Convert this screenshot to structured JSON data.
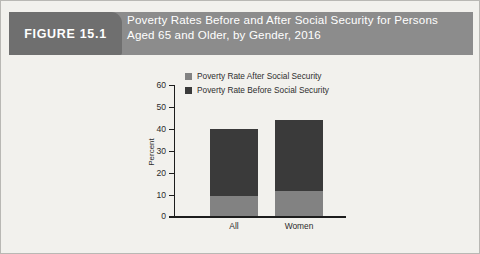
{
  "figure": {
    "tab_label": "FIGURE 15.1",
    "title_line1": "Poverty Rates Before and After Social Security for Persons",
    "title_line2": "Aged 65 and Older, by Gender, 2016",
    "header_bg": "#8c8c8c",
    "tab_bg": "#6f6f6f",
    "page_bg": "#f2f1ed",
    "border_color": "#b9b8b4"
  },
  "chart_data": {
    "type": "bar",
    "stacked": true,
    "title": "Poverty Rates Before and After Social Security for Persons Aged 65 and Older, by Gender, 2016",
    "xlabel": "",
    "ylabel": "Percent",
    "ylim": [
      0,
      60
    ],
    "yticks": [
      0,
      10,
      20,
      30,
      40,
      50,
      60
    ],
    "ytick_labels": [
      "0",
      "10",
      "20",
      "30",
      "40",
      "50",
      "60"
    ],
    "grid": false,
    "legend_position": "top-center",
    "categories": [
      "All",
      "Women"
    ],
    "series": [
      {
        "name": "Poverty Rate After Social Security",
        "color": "#828282",
        "values": [
          9.5,
          11.5
        ]
      },
      {
        "name": "Poverty Rate Before Social Security",
        "color": "#3a3a3a",
        "values": [
          40.0,
          43.8
        ]
      }
    ]
  }
}
